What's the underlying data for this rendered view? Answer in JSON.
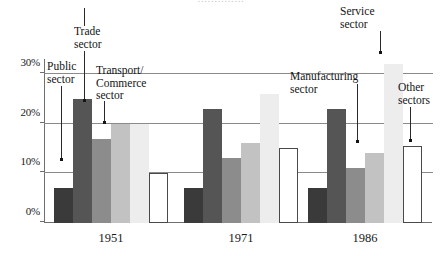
{
  "figure": {
    "clipped_header_text": "..............",
    "background_color": "#ffffff"
  },
  "chart_data": {
    "type": "bar",
    "title": "",
    "subtitle": "",
    "xlabel": "",
    "ylabel": "",
    "grid": true,
    "legend_position": "annotations",
    "categories": [
      "1951",
      "1971",
      "1986"
    ],
    "ylim": [
      0,
      33
    ],
    "yticks": [
      0,
      10,
      20,
      30
    ],
    "ytick_labels": [
      "0%",
      "10%",
      "20%",
      "30%"
    ],
    "series": [
      {
        "name": "Public sector",
        "color": "#3a3a3a",
        "values": [
          7,
          7,
          7
        ]
      },
      {
        "name": "Manufacturing sector",
        "color": "#555555",
        "values": [
          25,
          23,
          23
        ]
      },
      {
        "name": "Trade sector",
        "color": "#8c8c8c",
        "values": [
          17,
          13,
          11
        ]
      },
      {
        "name": "Transport/Commerce sector",
        "color": "#c2c2c2",
        "values": [
          20,
          16,
          14
        ]
      },
      {
        "name": "Service sector",
        "color": "#ededed",
        "values": [
          20,
          26,
          32
        ]
      },
      {
        "name": "Other sectors",
        "color": "#ffffff",
        "values": [
          10,
          15,
          15.5
        ]
      }
    ]
  },
  "annotations": {
    "public_sector": {
      "line1": "Public",
      "line2": "sector"
    },
    "trade_sector": {
      "line1": "Trade",
      "line2": "sector"
    },
    "transport_sector": {
      "line1": "Transport/",
      "line2": "Commerce",
      "line3": "sector"
    },
    "manufacturing": {
      "line1": "Manufacturing",
      "line2": "sector"
    },
    "service_sector": {
      "line1": "Service",
      "line2": "sector"
    },
    "other_sectors": {
      "line1": "Other",
      "line2": "sectors"
    }
  },
  "axis": {
    "tick_0": "0%",
    "tick_10": "10%",
    "tick_20": "20%",
    "tick_30": "30%",
    "cat_1951": "1951",
    "cat_1971": "1971",
    "cat_1986": "1986"
  }
}
